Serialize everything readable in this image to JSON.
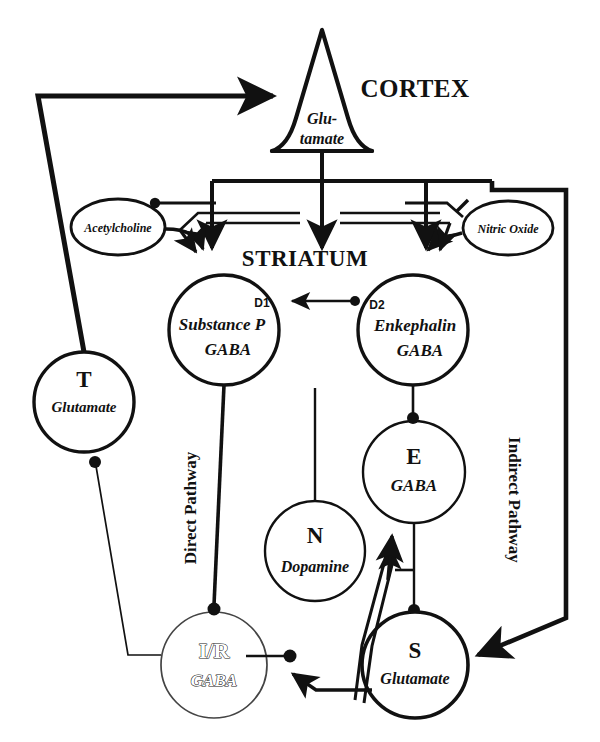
{
  "figure": {
    "type": "neuroanatomy-circuit-diagram",
    "background_color": "#ffffff",
    "line_color": "#111111"
  },
  "regions": [
    {
      "id": "cortex",
      "label": "CORTEX",
      "x": 415,
      "y": 97,
      "font_size": 25
    },
    {
      "id": "striatum",
      "label": "STRIATUM",
      "x": 305,
      "y": 258,
      "font_size": 23
    }
  ],
  "pathway_labels": [
    {
      "id": "direct",
      "label": "Direct Pathway",
      "x": 196,
      "y": 508,
      "rotation": -90,
      "font_size": 17
    },
    {
      "id": "indirect",
      "label": "Indirect Pathway",
      "x": 509,
      "y": 500,
      "rotation": 90,
      "font_size": 17
    }
  ],
  "cortex_neuron": {
    "shape": "pyramidal-triangle",
    "label_line1": "Glu-",
    "label_line2": "tamate",
    "apex_x": 322,
    "apex_y": 30,
    "base_y": 152,
    "font_size": 16
  },
  "nodes": [
    {
      "id": "acetylcholine",
      "shape": "ellipse",
      "cx": 118,
      "cy": 227,
      "rx": 47,
      "ry": 28,
      "label": "Acetylcholine",
      "font_size": 12,
      "stroke_width": 2.6,
      "text_style": "italic-bold"
    },
    {
      "id": "nitric-oxide",
      "shape": "ellipse",
      "cx": 508,
      "cy": 228,
      "rx": 45,
      "ry": 27,
      "label": "Nitric Oxide",
      "font_size": 12,
      "stroke_width": 2.6,
      "text_style": "italic-bold"
    },
    {
      "id": "substance-p",
      "shape": "circle",
      "cx": 224,
      "cy": 330,
      "r": 55,
      "letter": "",
      "receptor": "D1",
      "receptor_x": 262,
      "receptor_y": 305,
      "label_line1": "Substance P",
      "label_line2": "GABA",
      "font_size": 16,
      "stroke_width": 3.2
    },
    {
      "id": "enkephalin",
      "shape": "circle",
      "cx": 413,
      "cy": 330,
      "r": 55,
      "letter": "",
      "receptor": "D2",
      "receptor_x": 376,
      "receptor_y": 306,
      "label_line1": "Enkephalin",
      "label_line2": "GABA",
      "font_size": 16,
      "stroke_width": 3.2
    },
    {
      "id": "thalamus",
      "shape": "circle",
      "cx": 84,
      "cy": 402,
      "r": 50,
      "letter": "T",
      "label_line2": "Glutamate",
      "font_size": 15,
      "letter_size": 22,
      "stroke_width": 3.2
    },
    {
      "id": "external-pallidum",
      "shape": "circle",
      "cx": 414,
      "cy": 472,
      "r": 51,
      "letter": "E",
      "label_line2": "GABA",
      "font_size": 16,
      "letter_size": 22,
      "stroke_width": 2.2
    },
    {
      "id": "nigra-compacta",
      "shape": "circle",
      "cx": 315,
      "cy": 551,
      "r": 50,
      "letter": "N",
      "label_line2": "Dopamine",
      "font_size": 16,
      "letter_size": 22,
      "stroke_width": 2.2
    },
    {
      "id": "internal-pallidum-reticulata",
      "shape": "circle",
      "cx": 214,
      "cy": 665,
      "r": 53,
      "letter": "I/R",
      "label_line2": "GABA",
      "font_size": 16,
      "letter_size": 21,
      "stroke_width": 1.6,
      "text_fill": "hollow"
    },
    {
      "id": "subthalamic",
      "shape": "circle",
      "cx": 415,
      "cy": 665,
      "r": 53,
      "letter": "S",
      "label_line2": "Glutamate",
      "font_size": 15,
      "letter_size": 22,
      "stroke_width": 3.2
    }
  ],
  "connections": [
    {
      "id": "cortex-to-striatum-trunk",
      "from": "cortex",
      "to": "striatum",
      "style": "thick-line"
    },
    {
      "id": "cortex-to-substance-p",
      "from": "cortex",
      "to": "substance-p",
      "terminal": "arrow"
    },
    {
      "id": "cortex-to-enkephalin",
      "from": "cortex",
      "to": "enkephalin",
      "terminal": "arrow"
    },
    {
      "id": "cortex-to-subthalamic",
      "from": "cortex",
      "to": "subthalamic",
      "terminal": "arrow"
    },
    {
      "id": "acetylcholine-to-substance-p",
      "from": "acetylcholine",
      "to": "substance-p",
      "terminal": "arrow"
    },
    {
      "id": "striatum-to-acetylcholine",
      "from": "striatum",
      "to": "acetylcholine",
      "terminal": "dot"
    },
    {
      "id": "nitric-oxide-to-striatum",
      "from": "nitric-oxide",
      "to": "striatum",
      "terminal": "arrow"
    },
    {
      "id": "striatum-to-nitric-oxide",
      "from": "striatum",
      "to": "nitric-oxide",
      "terminal": "tbar"
    },
    {
      "id": "enkephalin-to-substance-p",
      "from": "enkephalin",
      "to": "substance-p",
      "terminal": "arrow"
    },
    {
      "id": "substance-p-to-internal-pallidum",
      "from": "substance-p",
      "to": "internal-pallidum-reticulata",
      "terminal": "dot",
      "style": "thick-line"
    },
    {
      "id": "enkephalin-to-external-pallidum",
      "from": "enkephalin",
      "to": "external-pallidum",
      "terminal": "dot"
    },
    {
      "id": "external-pallidum-to-subthalamic",
      "from": "external-pallidum",
      "to": "subthalamic",
      "terminal": "dot"
    },
    {
      "id": "subthalamic-to-external-pallidum",
      "from": "subthalamic",
      "to": "external-pallidum",
      "terminal": "arrow",
      "style": "thick-double"
    },
    {
      "id": "subthalamic-to-internal-pallidum",
      "from": "subthalamic",
      "to": "internal-pallidum-reticulata",
      "terminal": "arrow"
    },
    {
      "id": "nigra-to-striatum",
      "from": "nigra-compacta",
      "to": "striatum",
      "style": "line"
    },
    {
      "id": "internal-pallidum-to-thalamus",
      "from": "internal-pallidum-reticulata",
      "to": "thalamus",
      "terminal": "dot"
    },
    {
      "id": "thalamus-to-cortex",
      "from": "thalamus",
      "to": "cortex",
      "terminal": "arrow",
      "style": "thick-line"
    }
  ]
}
